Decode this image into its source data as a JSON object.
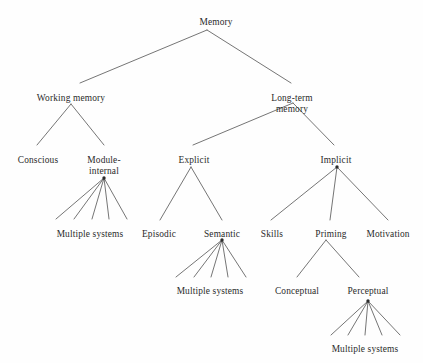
{
  "diagram": {
    "type": "hierarchy-tree",
    "background_color": "#fefefe",
    "line_color": "#3a3a3a",
    "text_color": "#2b2b2b",
    "nodes": [
      {
        "id": "memory",
        "label": "Memory",
        "x": 216,
        "y": 17,
        "level": 0
      },
      {
        "id": "working-memory",
        "label": "Working memory",
        "x": 71,
        "y": 93,
        "level": 1
      },
      {
        "id": "long-term-memory",
        "label": "Long-term memory",
        "x": 292,
        "y": 93,
        "level": 1
      },
      {
        "id": "conscious",
        "label": "Conscious",
        "x": 38,
        "y": 155,
        "level": 2
      },
      {
        "id": "module-internal",
        "label": "Module-internal",
        "x": 104,
        "y": 155,
        "level": 2
      },
      {
        "id": "explicit",
        "label": "Explicit",
        "x": 194,
        "y": 155,
        "level": 2
      },
      {
        "id": "implicit",
        "label": "Implicit",
        "x": 336,
        "y": 155,
        "level": 2
      },
      {
        "id": "wm-multiple",
        "label": "Multiple systems",
        "x": 90,
        "y": 229,
        "level": 3
      },
      {
        "id": "episodic",
        "label": "Episodic",
        "x": 159,
        "y": 229,
        "level": 3
      },
      {
        "id": "semantic",
        "label": "Semantic",
        "x": 222,
        "y": 229,
        "level": 3
      },
      {
        "id": "skills",
        "label": "Skills",
        "x": 272,
        "y": 229,
        "level": 3
      },
      {
        "id": "priming",
        "label": "Priming",
        "x": 331,
        "y": 229,
        "level": 3
      },
      {
        "id": "motivation",
        "label": "Motivation",
        "x": 388,
        "y": 229,
        "level": 3
      },
      {
        "id": "sem-multiple",
        "label": "Multiple systems",
        "x": 210,
        "y": 286,
        "level": 4
      },
      {
        "id": "conceptual",
        "label": "Conceptual",
        "x": 297,
        "y": 286,
        "level": 4
      },
      {
        "id": "perceptual",
        "label": "Perceptual",
        "x": 368,
        "y": 286,
        "level": 4
      },
      {
        "id": "perc-multiple",
        "label": "Multiple systems",
        "x": 365,
        "y": 344,
        "level": 5
      }
    ],
    "edges": [
      {
        "from": "memory",
        "to": "working-memory",
        "x1": 207,
        "y1": 30,
        "x2": 80,
        "y2": 83
      },
      {
        "from": "memory",
        "to": "long-term-memory",
        "x1": 207,
        "y1": 30,
        "x2": 291,
        "y2": 83
      },
      {
        "from": "working-memory",
        "to": "conscious",
        "x1": 71,
        "y1": 104,
        "x2": 37,
        "y2": 145
      },
      {
        "from": "working-memory",
        "to": "module-internal",
        "x1": 71,
        "y1": 104,
        "x2": 104,
        "y2": 145
      },
      {
        "from": "long-term-memory",
        "to": "explicit",
        "x1": 293,
        "y1": 103,
        "x2": 193,
        "y2": 145
      },
      {
        "from": "long-term-memory",
        "to": "implicit",
        "x1": 293,
        "y1": 103,
        "x2": 334,
        "y2": 145
      },
      {
        "from": "module-internal",
        "to": "wm-multiple",
        "x1": 104,
        "y1": 178,
        "x2": 56,
        "y2": 219
      },
      {
        "from": "module-internal",
        "to": "wm-multiple",
        "x1": 104,
        "y1": 178,
        "x2": 74,
        "y2": 219
      },
      {
        "from": "module-internal",
        "to": "wm-multiple",
        "x1": 104,
        "y1": 178,
        "x2": 92,
        "y2": 219
      },
      {
        "from": "module-internal",
        "to": "wm-multiple",
        "x1": 104,
        "y1": 178,
        "x2": 109,
        "y2": 219
      },
      {
        "from": "module-internal",
        "to": "wm-multiple",
        "x1": 104,
        "y1": 178,
        "x2": 127,
        "y2": 219
      },
      {
        "from": "explicit",
        "to": "episodic",
        "x1": 191,
        "y1": 167,
        "x2": 160,
        "y2": 220
      },
      {
        "from": "explicit",
        "to": "semantic",
        "x1": 191,
        "y1": 167,
        "x2": 222,
        "y2": 220
      },
      {
        "from": "implicit",
        "to": "skills",
        "x1": 337,
        "y1": 167,
        "x2": 271,
        "y2": 220
      },
      {
        "from": "implicit",
        "to": "priming",
        "x1": 337,
        "y1": 167,
        "x2": 330,
        "y2": 220
      },
      {
        "from": "implicit",
        "to": "motivation",
        "x1": 337,
        "y1": 167,
        "x2": 388,
        "y2": 220
      },
      {
        "from": "semantic",
        "to": "sem-multiple",
        "x1": 222,
        "y1": 240,
        "x2": 176,
        "y2": 277
      },
      {
        "from": "semantic",
        "to": "sem-multiple",
        "x1": 222,
        "y1": 240,
        "x2": 194,
        "y2": 277
      },
      {
        "from": "semantic",
        "to": "sem-multiple",
        "x1": 222,
        "y1": 240,
        "x2": 211,
        "y2": 277
      },
      {
        "from": "semantic",
        "to": "sem-multiple",
        "x1": 222,
        "y1": 240,
        "x2": 228,
        "y2": 277
      },
      {
        "from": "semantic",
        "to": "sem-multiple",
        "x1": 222,
        "y1": 240,
        "x2": 246,
        "y2": 277
      },
      {
        "from": "priming",
        "to": "conceptual",
        "x1": 326,
        "y1": 240,
        "x2": 297,
        "y2": 277
      },
      {
        "from": "priming",
        "to": "perceptual",
        "x1": 326,
        "y1": 240,
        "x2": 359,
        "y2": 277
      },
      {
        "from": "perceptual",
        "to": "perc-multiple",
        "x1": 368,
        "y1": 301,
        "x2": 331,
        "y2": 335
      },
      {
        "from": "perceptual",
        "to": "perc-multiple",
        "x1": 368,
        "y1": 301,
        "x2": 348,
        "y2": 335
      },
      {
        "from": "perceptual",
        "to": "perc-multiple",
        "x1": 368,
        "y1": 301,
        "x2": 365,
        "y2": 335
      },
      {
        "from": "perceptual",
        "to": "perc-multiple",
        "x1": 368,
        "y1": 301,
        "x2": 382,
        "y2": 335
      },
      {
        "from": "perceptual",
        "to": "perc-multiple",
        "x1": 368,
        "y1": 301,
        "x2": 400,
        "y2": 335
      }
    ],
    "junction_dots": [
      {
        "id": "module-internal-junction",
        "x": 104,
        "y": 178
      },
      {
        "id": "semantic-junction",
        "x": 222,
        "y": 240
      },
      {
        "id": "implicit-junction",
        "x": 337,
        "y": 167
      },
      {
        "id": "perceptual-junction",
        "x": 368,
        "y": 301
      }
    ]
  }
}
